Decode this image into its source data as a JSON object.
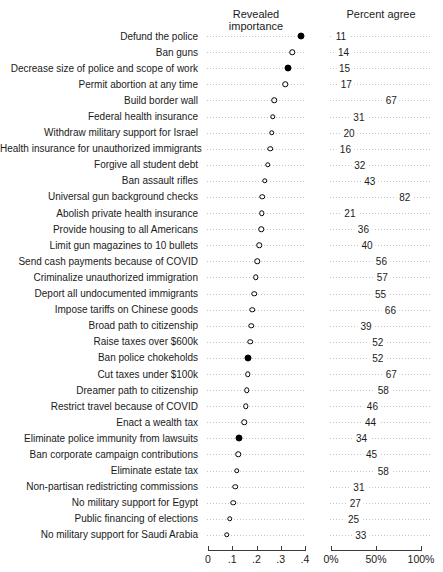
{
  "chart_data": {
    "type": "scatter",
    "subtype": "dot-plot-two-panels",
    "panels": {
      "left": {
        "title": "Revealed importance",
        "xlim": [
          0,
          0.4
        ],
        "ticks": [
          "0",
          ".1",
          ".2",
          ".3",
          ".4"
        ],
        "tick_values": [
          0,
          0.1,
          0.2,
          0.3,
          0.4
        ]
      },
      "right": {
        "title": "Percent agree",
        "xlim": [
          0,
          100
        ],
        "ticks": [
          "0%",
          "50%",
          "100%"
        ],
        "tick_values": [
          0,
          50,
          100
        ]
      }
    },
    "marker_styles": {
      "filled": "solid black dot",
      "hollow": "white dot with black outline"
    },
    "items": [
      {
        "label": "Defund the police",
        "importance": 0.38,
        "filled": true,
        "percent_agree": 11
      },
      {
        "label": "Ban guns",
        "importance": 0.345,
        "filled": false,
        "percent_agree": 14
      },
      {
        "label": "Decrease size of police and scope of work",
        "importance": 0.325,
        "filled": true,
        "percent_agree": 15
      },
      {
        "label": "Permit abortion at any time",
        "importance": 0.315,
        "filled": false,
        "percent_agree": 17
      },
      {
        "label": "Build border wall",
        "importance": 0.27,
        "filled": false,
        "percent_agree": 67
      },
      {
        "label": "Federal health insurance",
        "importance": 0.265,
        "filled": false,
        "percent_agree": 31
      },
      {
        "label": "Withdraw military support for Israel",
        "importance": 0.26,
        "filled": false,
        "percent_agree": 20
      },
      {
        "label": "Health insurance for unauthorized immigrants",
        "importance": 0.253,
        "filled": false,
        "percent_agree": 16
      },
      {
        "label": "Forgive all student debt",
        "importance": 0.243,
        "filled": false,
        "percent_agree": 32
      },
      {
        "label": "Ban assault rifles",
        "importance": 0.232,
        "filled": false,
        "percent_agree": 43
      },
      {
        "label": "Universal gun background checks",
        "importance": 0.221,
        "filled": false,
        "percent_agree": 82
      },
      {
        "label": "Abolish private health insurance",
        "importance": 0.219,
        "filled": false,
        "percent_agree": 21
      },
      {
        "label": "Provide housing to all Americans",
        "importance": 0.216,
        "filled": false,
        "percent_agree": 36
      },
      {
        "label": "Limit gun magazines to 10 bullets",
        "importance": 0.209,
        "filled": false,
        "percent_agree": 40
      },
      {
        "label": "Send cash payments because of COVID",
        "importance": 0.201,
        "filled": false,
        "percent_agree": 56
      },
      {
        "label": "Criminalize unauthorized immigration",
        "importance": 0.194,
        "filled": false,
        "percent_agree": 57
      },
      {
        "label": "Deport all undocumented immigrants",
        "importance": 0.188,
        "filled": false,
        "percent_agree": 55
      },
      {
        "label": "Impose tariffs on Chinese goods",
        "importance": 0.18,
        "filled": false,
        "percent_agree": 66
      },
      {
        "label": "Broad path to citizenship",
        "importance": 0.175,
        "filled": false,
        "percent_agree": 39
      },
      {
        "label": "Raise taxes over $600k",
        "importance": 0.171,
        "filled": false,
        "percent_agree": 52
      },
      {
        "label": "Ban police chokeholds",
        "importance": 0.164,
        "filled": true,
        "percent_agree": 52
      },
      {
        "label": "Cut taxes under $100k",
        "importance": 0.161,
        "filled": false,
        "percent_agree": 67
      },
      {
        "label": "Dreamer path to citizenship",
        "importance": 0.157,
        "filled": false,
        "percent_agree": 58
      },
      {
        "label": "Restrict travel because of COVID",
        "importance": 0.153,
        "filled": false,
        "percent_agree": 46
      },
      {
        "label": "Enact a wealth tax",
        "importance": 0.147,
        "filled": false,
        "percent_agree": 44
      },
      {
        "label": "Eliminate police immunity from lawsuits",
        "importance": 0.127,
        "filled": true,
        "percent_agree": 34
      },
      {
        "label": "Ban corporate campaign contributions",
        "importance": 0.123,
        "filled": false,
        "percent_agree": 45
      },
      {
        "label": "Eliminate estate tax",
        "importance": 0.116,
        "filled": false,
        "percent_agree": 58
      },
      {
        "label": "Non-partisan redistricting commissions",
        "importance": 0.109,
        "filled": false,
        "percent_agree": 31
      },
      {
        "label": "No military support for Egypt",
        "importance": 0.102,
        "filled": false,
        "percent_agree": 27
      },
      {
        "label": "Public financing of elections",
        "importance": 0.088,
        "filled": false,
        "percent_agree": 25
      },
      {
        "label": "No military support for Saudi Arabia",
        "importance": 0.075,
        "filled": false,
        "percent_agree": 33
      }
    ]
  }
}
